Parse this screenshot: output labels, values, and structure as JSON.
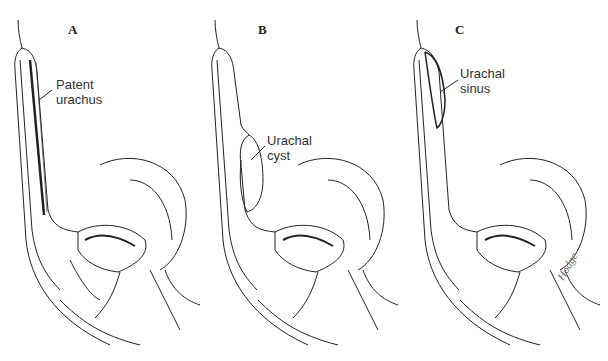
{
  "figure": {
    "panels": [
      {
        "letter": "A",
        "label_line1": "Patent",
        "label_line2": "urachus"
      },
      {
        "letter": "B",
        "label_line1": "Urachal",
        "label_line2": "cyst"
      },
      {
        "letter": "C",
        "label_line1": "Urachal",
        "label_line2": "sinus"
      }
    ],
    "signature": "Hodge",
    "colors": {
      "line": "#222222",
      "background": "#ffffff"
    }
  }
}
